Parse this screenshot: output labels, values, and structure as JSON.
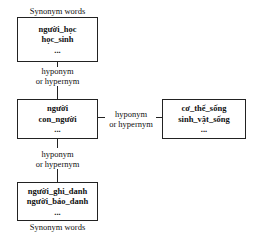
{
  "diagram": {
    "nodes": [
      {
        "id": "synonyms-top",
        "terms": [
          "người_học",
          "học_sinh",
          "..."
        ],
        "caption": "Synonym words"
      },
      {
        "id": "center",
        "terms": [
          "người",
          "con_người",
          "..."
        ]
      },
      {
        "id": "right",
        "terms": [
          "cơ_thể_sống",
          "sinh_vật_sống",
          "..."
        ]
      },
      {
        "id": "synonyms-bottom",
        "terms": [
          "người_ghi_danh",
          "người_báo_danh",
          "..."
        ],
        "caption": "Synonym words"
      }
    ],
    "edges": [
      {
        "from": "synonyms-top",
        "to": "center",
        "label_line1": "hyponym",
        "label_line2": "or hypernym"
      },
      {
        "from": "center",
        "to": "right",
        "label_line1": "hyponym",
        "label_line2": "or hypernym"
      },
      {
        "from": "center",
        "to": "synonyms-bottom",
        "label_line1": "hyponym",
        "label_line2": "or hypernym"
      }
    ]
  }
}
